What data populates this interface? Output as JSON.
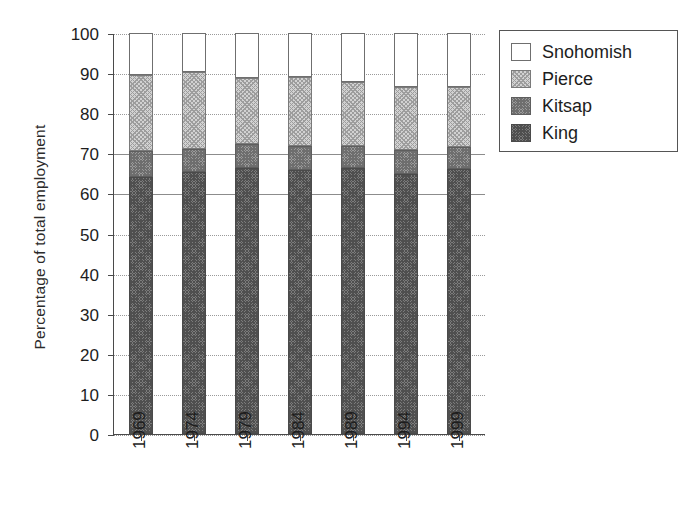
{
  "chart_data": {
    "type": "bar",
    "subtype": "stacked-bar-percent",
    "title": "",
    "xlabel": "",
    "ylabel": "Percentage of total employment",
    "categories": [
      "1969",
      "1974",
      "1979",
      "1984",
      "1989",
      "1994",
      "1999"
    ],
    "ylim": [
      0,
      100
    ],
    "ytick_labels": [
      "0",
      "10",
      "20",
      "30",
      "40",
      "50",
      "60",
      "70",
      "80",
      "90",
      "100"
    ],
    "ytick_values": [
      0,
      10,
      20,
      30,
      40,
      50,
      60,
      70,
      80,
      90,
      100
    ],
    "grid": true,
    "legend_position": "right-top",
    "stack_order_bottom_to_top": [
      "King",
      "Kitsap",
      "Pierce",
      "Snohomish"
    ],
    "series": [
      {
        "name": "King",
        "color": "#7c7c7c",
        "pattern": "dark-checker",
        "values": [
          64.1,
          65.3,
          66.3,
          65.8,
          66.3,
          64.8,
          66.1
        ]
      },
      {
        "name": "Kitsap",
        "color": "#9b9b9b",
        "pattern": "medium-crosshatch",
        "values": [
          6.5,
          5.8,
          6.0,
          6.0,
          5.5,
          6.0,
          5.5
        ]
      },
      {
        "name": "Pierce",
        "color": "#d2d2d2",
        "pattern": "light-crosshatch",
        "values": [
          18.9,
          19.2,
          16.5,
          17.2,
          16.0,
          15.8,
          15.0
        ]
      },
      {
        "name": "Snohomish",
        "color": "#ffffff",
        "pattern": "empty",
        "values": [
          10.5,
          9.7,
          11.2,
          11.0,
          12.2,
          13.4,
          13.4
        ]
      }
    ],
    "cumulative_tops": {
      "King": [
        64.1,
        65.3,
        66.3,
        65.8,
        66.3,
        64.8,
        66.1
      ],
      "Kitsap": [
        70.6,
        71.1,
        72.3,
        71.8,
        71.8,
        70.8,
        71.6
      ],
      "Pierce": [
        89.5,
        90.3,
        88.8,
        89.0,
        87.8,
        86.6,
        86.6
      ],
      "Snohomish": [
        100.0,
        100.0,
        100.0,
        100.0,
        100.0,
        100.0,
        100.0
      ]
    }
  },
  "legend": {
    "items": [
      {
        "label": "Snohomish",
        "swatch": "fill-snohomish"
      },
      {
        "label": "Pierce",
        "swatch": "fill-pierce"
      },
      {
        "label": "Kitsap",
        "swatch": "fill-kitsap"
      },
      {
        "label": "King",
        "swatch": "fill-king"
      }
    ]
  }
}
